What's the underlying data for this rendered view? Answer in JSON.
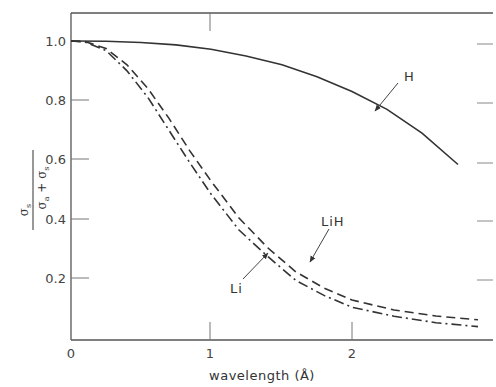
{
  "chart_data": {
    "type": "line",
    "title": "",
    "xlabel": "wavelength (Å)",
    "ylabel": "σs / (σa + σs)",
    "ylabel_parts": {
      "num": "σ",
      "num_sub": "s",
      "den_a": "σ",
      "den_a_sub": "a",
      "plus": "+",
      "den_s": "σ",
      "den_s_sub": "s"
    },
    "xlim": [
      0,
      2.9
    ],
    "ylim": [
      0,
      1.1
    ],
    "xticks": [
      0,
      1,
      2
    ],
    "xtick_labels": [
      "0",
      "1",
      "2"
    ],
    "yticks": [
      0.2,
      0.4,
      0.6,
      0.8,
      1.0
    ],
    "ytick_labels": [
      "0.2",
      "0.4",
      "0.6",
      "0.8",
      "1.0"
    ],
    "grid": false,
    "legend": "none (curves labeled directly with arrows)",
    "series": [
      {
        "name": "H",
        "style": "solid",
        "x": [
          0,
          0.25,
          0.5,
          0.75,
          1.0,
          1.25,
          1.5,
          1.75,
          2.0,
          2.25,
          2.5,
          2.75
        ],
        "y": [
          1.0,
          0.999,
          0.995,
          0.987,
          0.972,
          0.95,
          0.92,
          0.88,
          0.83,
          0.77,
          0.69,
          0.585
        ]
      },
      {
        "name": "LiH",
        "style": "dashed",
        "x": [
          0,
          0.1,
          0.25,
          0.4,
          0.55,
          0.7,
          0.85,
          1.0,
          1.2,
          1.4,
          1.6,
          1.8,
          2.0,
          2.3,
          2.6,
          2.9
        ],
        "y": [
          1.0,
          0.998,
          0.975,
          0.92,
          0.84,
          0.74,
          0.63,
          0.53,
          0.41,
          0.31,
          0.23,
          0.175,
          0.135,
          0.1,
          0.08,
          0.068
        ]
      },
      {
        "name": "Li",
        "style": "dash-dot",
        "x": [
          0,
          0.1,
          0.25,
          0.4,
          0.55,
          0.7,
          0.85,
          1.0,
          1.2,
          1.4,
          1.6,
          1.8,
          2.0,
          2.3,
          2.6,
          2.9
        ],
        "y": [
          1.0,
          0.997,
          0.968,
          0.9,
          0.81,
          0.7,
          0.59,
          0.49,
          0.37,
          0.28,
          0.2,
          0.15,
          0.11,
          0.08,
          0.058,
          0.045
        ]
      }
    ],
    "annotations": [
      {
        "text": "H",
        "target_series": "H",
        "arrow": true
      },
      {
        "text": "LiH",
        "target_series": "LiH",
        "arrow": true
      },
      {
        "text": "Li",
        "target_series": "Li",
        "arrow": true
      }
    ]
  },
  "labels": {
    "x_title": "wavelength (Å)",
    "ann_H": "H",
    "ann_LiH": "LiH",
    "ann_Li": "Li",
    "x0": "0",
    "x1": "1",
    "x2": "2",
    "y02": "0.2",
    "y04": "0.4",
    "y06": "0.6",
    "y08": "0.8",
    "y10": "1.0"
  },
  "colors": {
    "line": "#333333",
    "axis": "#555555",
    "background": "#ffffff"
  }
}
